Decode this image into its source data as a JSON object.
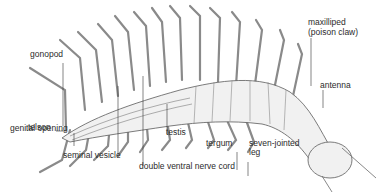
{
  "diagram": {
    "colors": {
      "ink": "#3a3a3a",
      "body_fill": "#f1f1f1",
      "shade": "#d8d8d8",
      "background": "#ffffff"
    },
    "labels": {
      "gonopod": "gonopod",
      "telson": "telson",
      "genital_opening": "genital opening",
      "seminal_vesicle": "seminal vesicle",
      "double_ventral_nerve_cord": "double ventral nerve cord",
      "testis": "testis",
      "tergum": "tergum",
      "seven_jointed_leg_1": "seven-jointed",
      "seven_jointed_leg_2": "leg",
      "maxilliped_1": "maxilliped",
      "maxilliped_2": "(poison claw)",
      "antenna": "antenna"
    }
  }
}
